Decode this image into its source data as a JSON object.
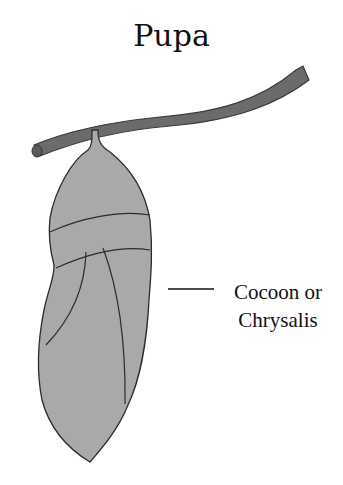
{
  "title": "Pupa",
  "labels": [
    {
      "line1": "Cocoon or",
      "line2": "Chrysalis"
    }
  ],
  "colors": {
    "body_fill": "#a9a9a9",
    "twig_fill": "#6b6b6b",
    "outline": "#2b2b2b",
    "text": "#111111"
  }
}
